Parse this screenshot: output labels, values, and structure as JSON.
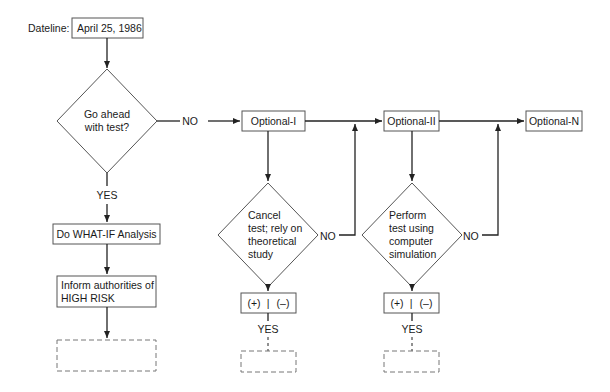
{
  "diagram": {
    "dateline": {
      "label": "Dateline:",
      "date": "April 25, 1986"
    },
    "main_decision": {
      "lines": [
        "Go ahead",
        "with test?"
      ],
      "no_label": "NO",
      "yes_label": "YES"
    },
    "left_branch": {
      "whatif": "Do WHAT-IF Analysis",
      "inform_lines": [
        "Inform authorities of",
        "HIGH RISK"
      ],
      "placeholder": ""
    },
    "optionals": [
      {
        "label": "Optional-I",
        "decision_lines": [
          "Cancel",
          "test; rely on",
          "theoretical",
          "study"
        ],
        "no_label": "NO",
        "result_plus": "(+)",
        "result_sep": "|",
        "result_minus": "(–)",
        "yes_label": "YES"
      },
      {
        "label": "Optional-II",
        "decision_lines": [
          "Perform",
          "test using",
          "computer",
          "simulation"
        ],
        "no_label": "NO",
        "result_plus": "(+)",
        "result_sep": "|",
        "result_minus": "(–)",
        "yes_label": "YES"
      },
      {
        "label": "Optional-N"
      }
    ]
  },
  "colors": {
    "stroke": "#555555",
    "line": "#222222",
    "text": "#1a1a1a",
    "background": "#ffffff"
  }
}
